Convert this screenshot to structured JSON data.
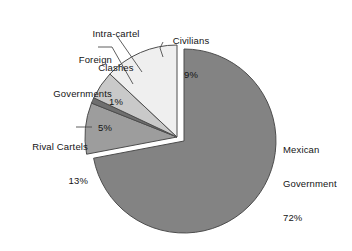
{
  "chart_data": {
    "type": "pie",
    "title": "",
    "subtitle": "",
    "xlabel": "",
    "ylabel": "",
    "grid": false,
    "legend_position": "none",
    "label_style": "external-with-leader-lines",
    "units": "percent",
    "total": 100,
    "categories": [
      "Mexican Government",
      "Civilians",
      "Intra-cartel Clashes",
      "Foreign Governments",
      "Rival Cartels"
    ],
    "values": [
      72,
      9,
      1,
      5,
      13
    ],
    "slices": [
      {
        "label": "Mexican Government",
        "label_line1": "Mexican",
        "label_line2": "Government",
        "value": 72,
        "value_text": "72%",
        "color": "#838383",
        "exploded": false,
        "start_angle_deg": 0,
        "end_angle_deg": 259.2
      },
      {
        "label": "Civilians",
        "label_line1": "Civilians",
        "label_line2": "",
        "value": 9,
        "value_text": "9%",
        "color": "#9d9d9d",
        "exploded": true,
        "start_angle_deg": 259.2,
        "end_angle_deg": 291.6
      },
      {
        "label": "Intra-cartel Clashes",
        "label_line1": "Intra-cartel",
        "label_line2": "Clashes",
        "value": 1,
        "value_text": "1%",
        "color": "#6f6f6f",
        "exploded": true,
        "start_angle_deg": 291.6,
        "end_angle_deg": 295.2
      },
      {
        "label": "Foreign Governments",
        "label_line1": "Foreign",
        "label_line2": "Governments",
        "value": 5,
        "value_text": "5%",
        "color": "#c9c9c9",
        "exploded": true,
        "start_angle_deg": 295.2,
        "end_angle_deg": 313.2
      },
      {
        "label": "Rival Cartels",
        "label_line1": "Rival Cartels",
        "label_line2": "",
        "value": 13,
        "value_text": "13%",
        "color": "#efefef",
        "exploded": true,
        "start_angle_deg": 313.2,
        "end_angle_deg": 360
      }
    ],
    "colors": {
      "mexican_government": "#838383",
      "civilians": "#9d9d9d",
      "intra_cartel_clashes": "#6f6f6f",
      "foreign_governments": "#c9c9c9",
      "rival_cartels": "#efefef",
      "outline": "#4d4d4d",
      "leader_line": "#4d4d4d",
      "background": "#ffffff",
      "text": "#141414"
    }
  }
}
